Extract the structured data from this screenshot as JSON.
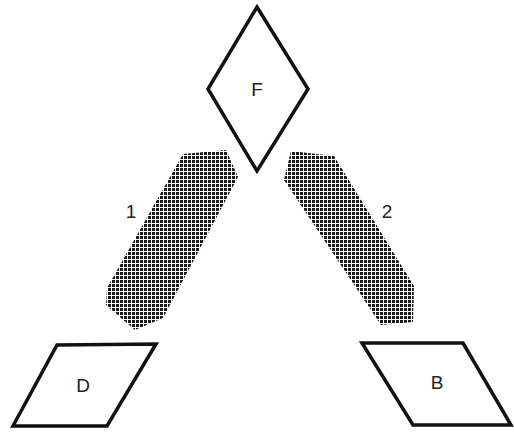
{
  "diagram": {
    "nodes": [
      {
        "id": "F",
        "label": "F",
        "shape": "diamond"
      },
      {
        "id": "D",
        "label": "D",
        "shape": "parallelogram"
      },
      {
        "id": "B",
        "label": "B",
        "shape": "parallelogram"
      }
    ],
    "bands": [
      {
        "id": "1",
        "label": "1",
        "connects": [
          "F",
          "D"
        ],
        "fill": "crosshatch-dots"
      },
      {
        "id": "2",
        "label": "2",
        "connects": [
          "F",
          "B"
        ],
        "fill": "crosshatch-dots"
      }
    ],
    "colors": {
      "stroke": "#111111",
      "hatch": "#1a1a1a",
      "background": "#ffffff"
    }
  }
}
